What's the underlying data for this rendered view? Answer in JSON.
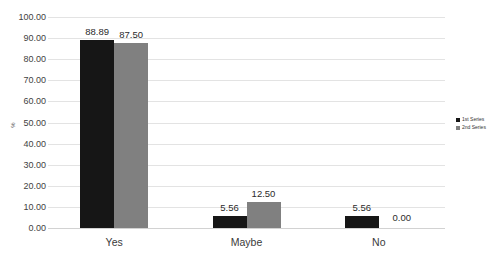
{
  "chart_data": {
    "type": "bar",
    "title": "",
    "xlabel": "",
    "ylabel": "%",
    "categories": [
      "Yes",
      "Maybe",
      "No"
    ],
    "series": [
      {
        "name": "1st Series",
        "color": "#161616",
        "values": [
          88.89,
          5.56,
          5.56
        ],
        "labels": [
          "88.89",
          "5.56",
          "5.56"
        ]
      },
      {
        "name": "2nd Series",
        "color": "#808080",
        "values": [
          87.5,
          12.5,
          0.0
        ],
        "labels": [
          "87.50",
          "12.50",
          "0.00"
        ]
      }
    ],
    "ylim": [
      0,
      100
    ],
    "ytick_step": 10,
    "ytick_labels": [
      "100.00",
      "90.00",
      "80.00",
      "70.00",
      "60.00",
      "50.00",
      "40.00",
      "30.00",
      "20.00",
      "10.00",
      "0.00"
    ],
    "ytick_values": [
      100,
      90,
      80,
      70,
      60,
      50,
      40,
      30,
      20,
      10,
      0
    ],
    "grid": true,
    "legend_position": "right",
    "data_labels": true
  },
  "legend": {
    "items": [
      {
        "label": "1st Series"
      },
      {
        "label": "2nd Series"
      }
    ]
  },
  "cropped_title": ""
}
